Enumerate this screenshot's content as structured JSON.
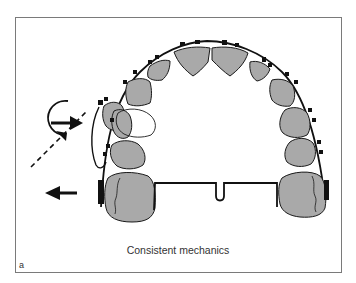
{
  "figure": {
    "caption": "Consistent mechanics",
    "panel_label": "a",
    "colors": {
      "tooth_fill": "#a9a9a9",
      "outline": "#1a1a1a",
      "frame": "#7a7a7a",
      "background": "#ffffff"
    },
    "elements": [
      "dental-arch-occlusal-view",
      "archwire",
      "brackets",
      "transpalatal-bar-with-loop",
      "molar-tubes",
      "rotation-arrow",
      "force-arrow-right",
      "dashed-force-arrow",
      "force-arrow-left",
      "displaced-tooth-outline"
    ]
  }
}
